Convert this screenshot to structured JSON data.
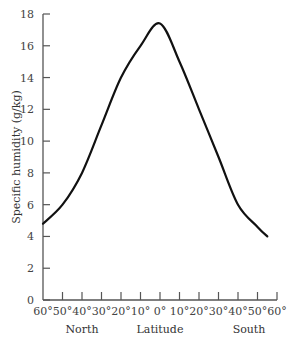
{
  "chart_data": {
    "type": "line",
    "title": "",
    "xlabel": "Latitude",
    "ylabel": "Specific humidity (g/kg)",
    "x_group_labels": [
      "North",
      "Latitude",
      "South"
    ],
    "x_tick_labels": [
      "60°",
      "50°",
      "40°",
      "30°",
      "20°",
      "10°",
      "0°",
      "10°",
      "20°",
      "30°",
      "40°",
      "50°",
      "60°"
    ],
    "y_ticks": [
      0,
      2,
      4,
      6,
      8,
      10,
      12,
      14,
      16,
      18
    ],
    "ylim": [
      0,
      18
    ],
    "xlim": [
      -60,
      60
    ],
    "x_note": "negative = North latitude, positive = South latitude",
    "grid": false,
    "legend": null,
    "series": [
      {
        "name": "Specific humidity",
        "x": [
          -60,
          -50,
          -40,
          -30,
          -20,
          -10,
          0,
          10,
          20,
          30,
          40,
          50,
          55
        ],
        "values": [
          4.8,
          6.0,
          8.0,
          11.0,
          14.0,
          16.0,
          17.4,
          15.0,
          12.0,
          9.0,
          6.0,
          4.6,
          4.0
        ]
      }
    ]
  }
}
